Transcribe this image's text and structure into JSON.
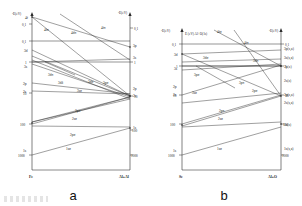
{
  "figure": {
    "kind": "molecular-orbital-correlation-diagram-pair",
    "background": "#ffffff",
    "line_color": "#2b2b2b"
  },
  "panels": [
    {
      "id": "a",
      "name": "a",
      "axis": {
        "y_label_left": "-E(eV)",
        "y_label_right": "-E(eV)",
        "y_scale": "log",
        "y_ticks": [
          "0,1",
          "0,1",
          "1",
          "10",
          "100",
          "1000"
        ],
        "y_ticks_right": [
          "0,1",
          "1",
          "10",
          "100",
          "1000"
        ],
        "x_left_label": "Fe",
        "x_right_label": "Al+Al"
      },
      "united_atom_orbitals": [
        "4f",
        "3d",
        "3s",
        "2p",
        "2s",
        "1s"
      ],
      "separated_atom_orbitals": [
        "3p",
        "3s",
        "2p",
        "2s",
        "1s"
      ],
      "mo_labels": [
        "4fσ",
        "4dπ",
        "4fπ",
        "3dπ",
        "3dδ",
        "3dσ",
        "3pσ",
        "2pπ",
        "2sσ",
        "2pσ",
        "3sσ",
        "1sσ"
      ],
      "band": {
        "label": "hatched-band",
        "hatch": true
      }
    },
    {
      "id": "b",
      "name": "b",
      "axis": {
        "y_label_left": "-E(eV)",
        "y_label_right": "-E(eV)",
        "y_scale": "log",
        "y_ticks": [
          "0,1",
          "1",
          "10",
          "100",
          "1000"
        ],
        "y_ticks_right": [
          "0,1",
          "1",
          "10",
          "100",
          "1000"
        ],
        "x_left_label": "Se",
        "x_right_label": "Al+O",
        "note": "E (eV) Al+O(1s)"
      },
      "united_atom_orbitals": [
        "3d",
        "3s",
        "2p",
        "2s",
        "1s"
      ],
      "separated_atom_orbitals": [
        "3p(s,a)",
        "3s(s,a)",
        "2p(z)",
        "2s(z)",
        "2p(s,a)",
        "2s(s,a)",
        "1s(z)",
        "1s(s,a)"
      ],
      "mo_labels": [
        "4fσ",
        "4fπ",
        "3dσ",
        "3dπ",
        "3pσ",
        "3pπ",
        "3sσ",
        "2pσ",
        "2pπ",
        "2sσ",
        "1sσ"
      ],
      "band": {
        "label": "hatched-band",
        "hatch": true
      }
    }
  ]
}
